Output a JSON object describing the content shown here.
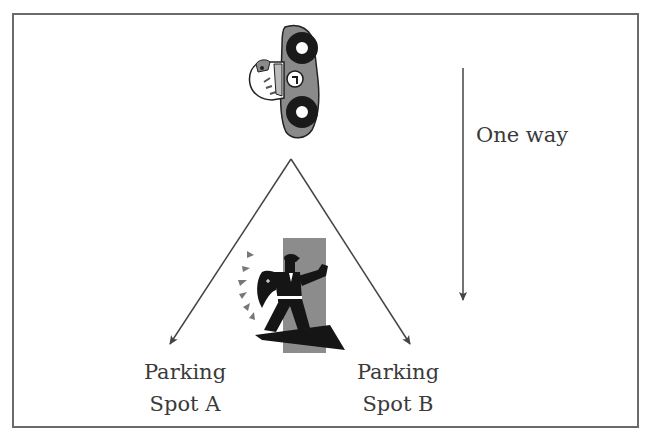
{
  "diagram": {
    "direction_label": "One way",
    "spots": [
      {
        "line1": "Parking",
        "line2": "Spot A"
      },
      {
        "line1": "Parking",
        "line2": "Spot B"
      }
    ],
    "car": {
      "icon": "race-car-icon",
      "number": "1"
    },
    "officer": {
      "icon": "traffic-officer-icon"
    },
    "colors": {
      "frame": "#6a6a6a",
      "arrow": "#444444",
      "text": "#3a3a3a",
      "car_body": "#8a8a8a",
      "tire": "#1a1a1a",
      "officer_bg": "#8c8c8c",
      "officer": "#151515"
    }
  }
}
